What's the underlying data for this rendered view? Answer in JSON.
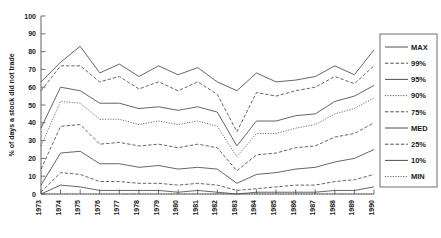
{
  "chart_data": {
    "type": "line",
    "title": "",
    "xlabel": "",
    "ylabel": "% of days a stock did not trade",
    "ylim": [
      0,
      100
    ],
    "yticks": [
      0,
      10,
      20,
      30,
      40,
      50,
      60,
      70,
      80,
      90,
      100
    ],
    "grid": false,
    "legend_position": "right",
    "categories": [
      "1973",
      "1974",
      "1975",
      "1976",
      "1977",
      "1978",
      "1979",
      "1980",
      "1981",
      "1982",
      "1983",
      "1984",
      "1985",
      "1986",
      "1987",
      "1988",
      "1989",
      "1990"
    ],
    "x": [
      1973,
      1974,
      1975,
      1976,
      1977,
      1978,
      1979,
      1980,
      1981,
      1982,
      1983,
      1984,
      1985,
      1986,
      1987,
      1988,
      1989,
      1990
    ],
    "series": [
      {
        "name": "MAX",
        "style": "solid",
        "values": [
          63,
          74,
          83,
          68,
          73,
          66,
          72,
          67,
          71,
          63,
          58,
          68,
          63,
          64,
          66,
          72,
          67,
          81
        ]
      },
      {
        "name": "99%",
        "style": "dashed",
        "values": [
          58,
          72,
          72,
          63,
          66,
          59,
          63,
          58,
          63,
          56,
          35,
          57,
          55,
          58,
          60,
          66,
          62,
          72
        ]
      },
      {
        "name": "95%",
        "style": "solid",
        "values": [
          37,
          60,
          58,
          51,
          51,
          48,
          49,
          47,
          49,
          46,
          27,
          41,
          41,
          44,
          45,
          52,
          55,
          61
        ]
      },
      {
        "name": "90%",
        "style": "dotted",
        "values": [
          27,
          52,
          51,
          42,
          42,
          39,
          41,
          39,
          41,
          38,
          21,
          34,
          34,
          37,
          39,
          45,
          48,
          54
        ]
      },
      {
        "name": "75%",
        "style": "dashed",
        "values": [
          14,
          38,
          39,
          28,
          29,
          27,
          28,
          26,
          28,
          26,
          13,
          22,
          23,
          26,
          27,
          32,
          34,
          40
        ]
      },
      {
        "name": "MED",
        "style": "solid",
        "values": [
          5,
          23,
          24,
          17,
          17,
          15,
          16,
          14,
          15,
          14,
          6,
          11,
          12,
          14,
          15,
          18,
          20,
          25
        ]
      },
      {
        "name": "25%",
        "style": "dashed",
        "values": [
          1,
          12,
          11,
          7,
          7,
          6,
          6,
          5,
          6,
          5,
          2,
          3,
          4,
          5,
          5,
          7,
          8,
          11
        ]
      },
      {
        "name": "10%",
        "style": "solid",
        "values": [
          0,
          5,
          4,
          2,
          2,
          2,
          2,
          1,
          2,
          1,
          0,
          1,
          1,
          1,
          1,
          2,
          2,
          4
        ]
      },
      {
        "name": "MIN",
        "style": "dotted",
        "values": [
          0,
          0,
          0,
          0,
          0,
          0,
          0,
          0,
          0,
          0,
          0,
          0,
          0,
          0,
          0,
          0,
          0,
          0
        ]
      }
    ],
    "legend_entries": [
      {
        "label": "MAX",
        "style": "solid"
      },
      {
        "label": "99%",
        "style": "dashed"
      },
      {
        "label": "95%",
        "style": "solid"
      },
      {
        "label": "90%",
        "style": "dotted"
      },
      {
        "label": "75%",
        "style": "dashed"
      },
      {
        "label": "MED",
        "style": "solid"
      },
      {
        "label": "25%",
        "style": "dashed"
      },
      {
        "label": "10%",
        "style": "solid"
      },
      {
        "label": "MIN",
        "style": "dotted"
      }
    ],
    "colors": {
      "axis": "#6f6f6f",
      "line": "#4a4a4a",
      "text": "#1a1a1a",
      "background": "#ffffff"
    }
  }
}
